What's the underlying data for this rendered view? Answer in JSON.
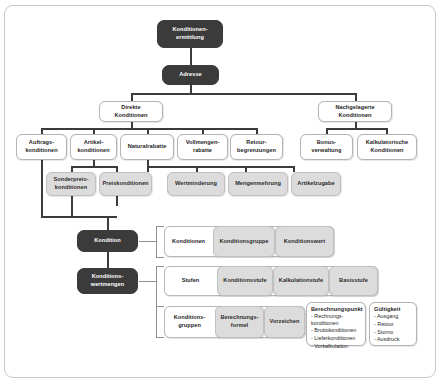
{
  "diagram": {
    "title_node": "Konditionen-\nermittlung",
    "nodes": {
      "konditionenermittlung": "Konditionen-\nermittlung",
      "adresse": "Adresse",
      "direkte_konditionen": "Direkte\nKonditionen",
      "nachgelagerte_konditionen": "Nachgelagerte\nKonditionen",
      "auftragskonditionen": "Auftrags-\nkonditionen",
      "artikelkonditionen": "Artikel-\nkonditionen",
      "naturalrabatte": "Naturalrabatte",
      "vollmengenrabatte": "Vollmengen-\nrabatte",
      "retourbegrenzungen": "Retour-\nbegrenzungen",
      "bonusverwaltung": "Bonus-\nverwaltung",
      "kalkulatorische_konditionen": "Kalkulatorische\nKonditionen",
      "sonderpreiskonditionen": "Sonderpreis-\nkonditionen",
      "preiskonditionen": "Preiskonditionen",
      "wertminderung": "Wertminderung",
      "mengenmehrung": "Mengenmehrung",
      "artikelzugabe": "Artikelzugabe",
      "kondition": "Kondition",
      "konditionswertmengen": "Konditions-\nwertmengen"
    },
    "detail_rows": [
      {
        "label": "Konditionen",
        "items": [
          "Konditionsgruppe",
          "Konditionswert"
        ]
      },
      {
        "label": "Stufen",
        "items": [
          "Konditionsstufe",
          "Kalkulationstufe",
          "Basisstufe"
        ]
      },
      {
        "label": "Konditions-\ngruppen",
        "items": [
          "Berechnungs-\nformel",
          "Vorzeichen"
        ]
      }
    ],
    "list_boxes": [
      {
        "title": "Berechnungspunkt",
        "items": [
          "Rechnungs-\nkonditionen",
          "Bruttokonditionen",
          "Lieferkonditionen",
          "Vorkalkulation"
        ]
      },
      {
        "title": "Gültigkeit",
        "items": [
          "Ausgang",
          "Retour",
          "Storno",
          "Ausdruck"
        ]
      }
    ],
    "colors": {
      "dark_node": "#3b3b3b",
      "grey_node": "#dcdcdc",
      "white_node": "#ffffff",
      "border": "#b4b4b4",
      "connector": "#3b3b3b",
      "frame": "#c9c9c9"
    }
  }
}
